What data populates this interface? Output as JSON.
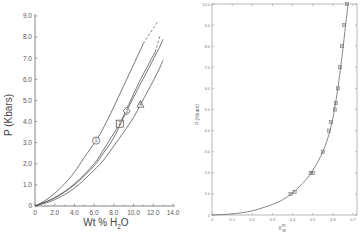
{
  "chart_data": [
    {
      "type": "line",
      "title": "",
      "xlabel": "Wt % H2O",
      "ylabel": "P (Kbars)",
      "xlim": [
        0,
        14.0
      ],
      "ylim": [
        0,
        9.0
      ],
      "grid": false,
      "x_ticks": [
        "0",
        "2.0",
        "4.0",
        "6.0",
        "8.0",
        "10.0",
        "12.0",
        "14.0"
      ],
      "y_ticks": [
        "0",
        "1.0",
        "2.0",
        "3.0",
        "4.0",
        "5.0",
        "6.0",
        "7.0",
        "8.0",
        "9.0"
      ],
      "series": [
        {
          "name": "1",
          "marker": "circle",
          "marker_at": [
            6.2,
            3.1
          ],
          "x": [
            0,
            1.0,
            2.0,
            3.0,
            4.0,
            5.0,
            6.2,
            7.0,
            8.0,
            9.0,
            10.0,
            11.0
          ],
          "y": [
            0,
            0.25,
            0.6,
            1.05,
            1.6,
            2.3,
            3.1,
            3.75,
            4.7,
            5.7,
            6.7,
            7.7
          ],
          "dashed_extension": {
            "x": [
              11.0,
              12.4
            ],
            "y": [
              7.7,
              8.7
            ]
          }
        },
        {
          "name": "2",
          "marker": "square",
          "marker_at": [
            8.6,
            3.9
          ],
          "x": [
            0,
            2.0,
            4.0,
            6.0,
            7.0,
            8.0,
            8.6,
            9.5,
            10.5,
            11.5,
            12.2
          ],
          "y": [
            0,
            0.4,
            1.05,
            2.0,
            2.7,
            3.45,
            3.9,
            4.8,
            5.8,
            6.7,
            7.3
          ],
          "dashed_extension": {
            "x": [
              12.2,
              12.7
            ],
            "y": [
              7.3,
              8.1
            ]
          }
        },
        {
          "name": "3",
          "marker": "diamond",
          "marker_at": [
            9.3,
            4.5
          ],
          "x": [
            0,
            2.0,
            4.0,
            6.0,
            7.0,
            8.0,
            9.3,
            10.5,
            11.5,
            12.5,
            13.0
          ],
          "y": [
            0,
            0.38,
            1.0,
            1.9,
            2.55,
            3.25,
            4.5,
            5.6,
            6.5,
            7.4,
            7.9
          ]
        },
        {
          "name": "4",
          "marker": "triangle",
          "marker_at": [
            10.7,
            4.8
          ],
          "x": [
            0,
            2.0,
            4.0,
            6.0,
            7.0,
            8.0,
            9.0,
            10.0,
            10.7,
            11.5,
            12.3,
            13.0
          ],
          "y": [
            0,
            0.3,
            0.85,
            1.7,
            2.2,
            2.85,
            3.5,
            4.2,
            4.8,
            5.5,
            6.2,
            6.9
          ]
        }
      ]
    },
    {
      "type": "line",
      "title": "",
      "xlabel": "X_w^m",
      "ylabel": "P (Kbars)",
      "xlim": [
        0,
        0.7
      ],
      "ylim": [
        0,
        10.0
      ],
      "grid": false,
      "x_ticks": [
        "0",
        "0.1",
        "0.2",
        "0.3",
        "0.4",
        "0.5",
        "0.6",
        "0.7"
      ],
      "y_ticks": [
        "0",
        "1.0",
        "2.0",
        "3.0",
        "4.0",
        "5.0",
        "6.0",
        "7.0",
        "8.0",
        "9.0",
        "10.0"
      ],
      "series": [
        {
          "name": "fit",
          "style": "line",
          "x": [
            0,
            0.1,
            0.2,
            0.3,
            0.35,
            0.4,
            0.45,
            0.5,
            0.55,
            0.58,
            0.6,
            0.62,
            0.64,
            0.66,
            0.675
          ],
          "y": [
            0,
            0.05,
            0.2,
            0.5,
            0.72,
            1.05,
            1.5,
            2.1,
            3.0,
            3.8,
            4.6,
            5.7,
            7.1,
            8.7,
            10.0
          ]
        },
        {
          "name": "data",
          "style": "markers",
          "x": [
            0.39,
            0.41,
            0.49,
            0.5,
            0.55,
            0.58,
            0.59,
            0.61,
            0.615,
            0.625,
            0.635,
            0.645,
            0.655,
            0.67
          ],
          "y": [
            1.0,
            1.1,
            2.0,
            2.0,
            3.0,
            4.0,
            4.4,
            5.0,
            5.3,
            6.0,
            7.0,
            8.0,
            9.0,
            10.0
          ]
        }
      ]
    }
  ],
  "left": {
    "xlabel_main": "Wt % H",
    "xlabel_sub": "2",
    "xlabel_end": "O",
    "ylabel": "P (Kbars)",
    "markers": {
      "m1": "1",
      "m2": "2",
      "m3": "3",
      "m4": "4"
    }
  },
  "right": {
    "xlabel_main": "X",
    "xlabel_sup": "m",
    "xlabel_sub": "w",
    "ylabel": "P (Kbars)"
  }
}
